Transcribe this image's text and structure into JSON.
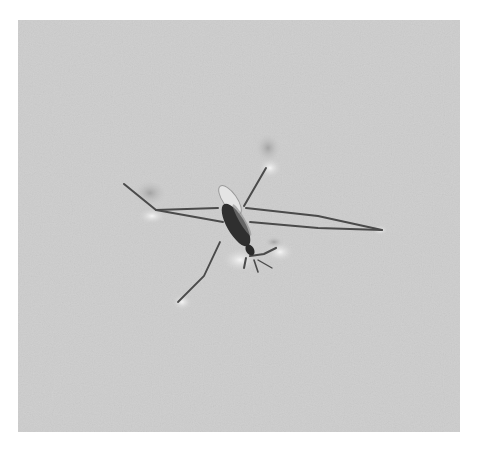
{
  "image": {
    "subject": "water strider on water surface",
    "alt": "Grayscale photograph of a water strider standing on a calm water surface, its long legs creating dimples in the surface tension",
    "colors": {
      "surround": "#ffffff",
      "water": "#cfcfcf",
      "water_light": "#d8d8d8",
      "dimple_shadow": "#a9a9a9",
      "dimple_highlight": "#f2f2f2",
      "leg": "#4a4a4a",
      "body_dark": "#2e2e2e",
      "wing": "#e6e6e6"
    },
    "photo_bounds": {
      "x": 18,
      "y": 20,
      "width": 442,
      "height": 412
    }
  }
}
